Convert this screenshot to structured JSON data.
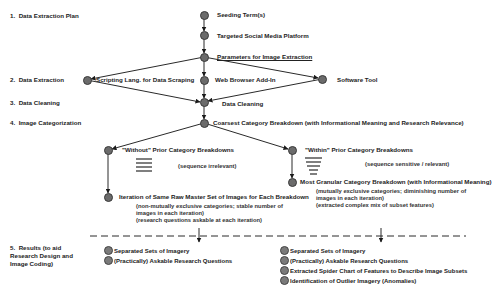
{
  "stages": [
    {
      "num": "1.",
      "label": "Data Extraction Plan"
    },
    {
      "num": "2.",
      "label": "Data Extraction"
    },
    {
      "num": "3.",
      "label": "Data Cleaning"
    },
    {
      "num": "4.",
      "label": "Image Categorization"
    },
    {
      "num": "5.",
      "label": "Results (to aid Research Design and Image Coding)"
    }
  ],
  "nodes": {
    "seeding": "Seeding Term(s)",
    "platform": "Targeted Social Media Platform",
    "parameters": "Parameters for Image Extraction",
    "scripting": "Scripting Lang. for Data Scraping",
    "browser": "Web Browser Add-In",
    "software": "Software Tool",
    "cleaning": "Data Cleaning",
    "coarsest": "Coarsest Category Breakdown (with Informational Meaning and Research Relevance)",
    "without": "\"Without\" Prior Category Breakdowns",
    "without_note": "(sequence irrelevant)",
    "iteration": "Iteration of Same Raw Master Set of Images for Each Breakdown",
    "iteration_notes": [
      "(non-mutually exclusive categories; stable number of",
      "images in each iteration)",
      "(research questions askable at each iteration)"
    ],
    "within": "\"Within\" Prior Category Breakdowns",
    "within_note": "(sequence sensitive / relevant)",
    "granular": "Most Granular Category Breakdown (with Informational Meaning)",
    "granular_notes": [
      "(mutually exclusive categories; diminishing number of",
      "images in each iteration)",
      "(extracted complex mix of subset features)"
    ]
  },
  "results": {
    "left": [
      "Separated Sets of Imagery",
      "(Practically) Askable Research Questions"
    ],
    "right": [
      "Separated Sets of Imagery",
      "(Practically) Askable Research Questions",
      "Extracted Spider Chart of Features to Describe Image Subsets",
      "Identification of Outlier Imagery (Anomalies)"
    ]
  },
  "colors": {
    "node_fill": "#6b6b6b",
    "line": "#2a2a2a",
    "background": "#ffffff"
  }
}
